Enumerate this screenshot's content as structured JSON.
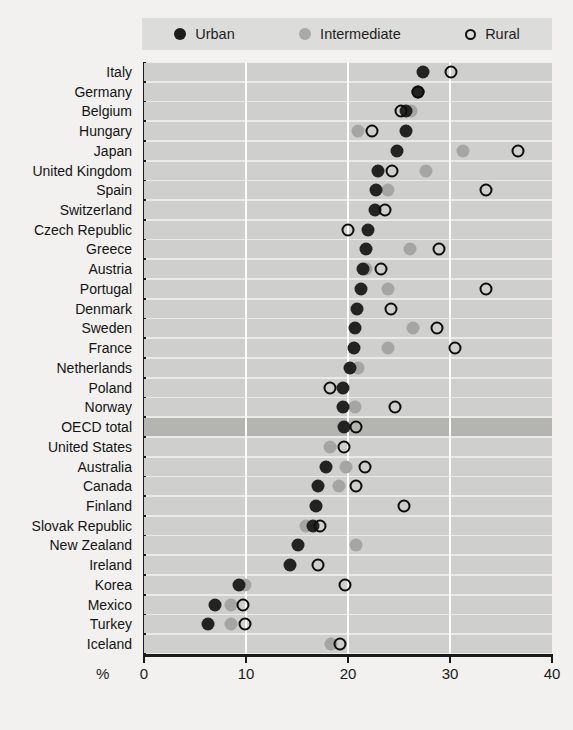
{
  "title": "Regional employment rate gap by region type (2005)",
  "legend": {
    "position": "top",
    "items": [
      {
        "label": "Urban",
        "icon": "filled-dark-circle-icon",
        "color": "#232323"
      },
      {
        "label": "Intermediate",
        "icon": "filled-grey-circle-icon",
        "color": "#a5a5a3"
      },
      {
        "label": "Rural",
        "icon": "open-circle-icon",
        "color": "#0d0d0d"
      }
    ]
  },
  "axis": {
    "unit_label": "%",
    "ticks": [
      "0",
      "10",
      "20",
      "30",
      "40"
    ],
    "highlight_row": "OECD total"
  },
  "chart_data": {
    "type": "scatter",
    "title": "Regional employment rate gap by region type (2005)",
    "xlabel": "%",
    "ylabel": "",
    "xlim": [
      0,
      40
    ],
    "xticks": [
      0,
      10,
      20,
      30,
      40
    ],
    "grid": "vertical",
    "legend_position": "top",
    "orientation": "horizontal-dot-plot",
    "categories": [
      "Italy",
      "Germany",
      "Belgium",
      "Hungary",
      "Japan",
      "United Kingdom",
      "Spain",
      "Switzerland",
      "Czech Republic",
      "Greece",
      "Austria",
      "Portugal",
      "Denmark",
      "Sweden",
      "France",
      "Netherlands",
      "Poland",
      "Norway",
      "OECD total",
      "United States",
      "Australia",
      "Canada",
      "Finland",
      "Slovak Republic",
      "New Zealand",
      "Ireland",
      "Korea",
      "Mexico",
      "Turkey",
      "Iceland"
    ],
    "series": [
      {
        "name": "Urban",
        "color": "#232323",
        "values": [
          27.4,
          26.9,
          25.7,
          25.7,
          24.8,
          22.9,
          22.7,
          22.6,
          22.0,
          21.8,
          21.5,
          21.3,
          20.9,
          20.7,
          20.6,
          20.2,
          19.5,
          19.5,
          19.6,
          null,
          17.8,
          17.1,
          16.9,
          16.6,
          15.1,
          14.3,
          9.3,
          7.0,
          6.3,
          null
        ]
      },
      {
        "name": "Intermediate",
        "color": "#a5a5a3",
        "values": [
          null,
          26.9,
          26.2,
          21.0,
          31.3,
          27.6,
          23.9,
          null,
          null,
          26.1,
          21.8,
          23.9,
          null,
          26.4,
          23.9,
          21.0,
          null,
          20.7,
          null,
          18.2,
          19.8,
          19.1,
          null,
          15.9,
          20.8,
          null,
          9.9,
          8.5,
          8.5,
          18.3
        ]
      },
      {
        "name": "Rural",
        "color": "#0d0d0d",
        "values": [
          30.1,
          26.9,
          25.2,
          22.4,
          36.7,
          24.3,
          33.5,
          23.6,
          20.0,
          28.9,
          23.2,
          33.5,
          24.2,
          28.7,
          30.5,
          null,
          18.2,
          24.6,
          20.8,
          19.6,
          21.7,
          20.8,
          25.5,
          17.3,
          null,
          17.1,
          19.7,
          9.7,
          9.9,
          19.2
        ]
      }
    ]
  }
}
